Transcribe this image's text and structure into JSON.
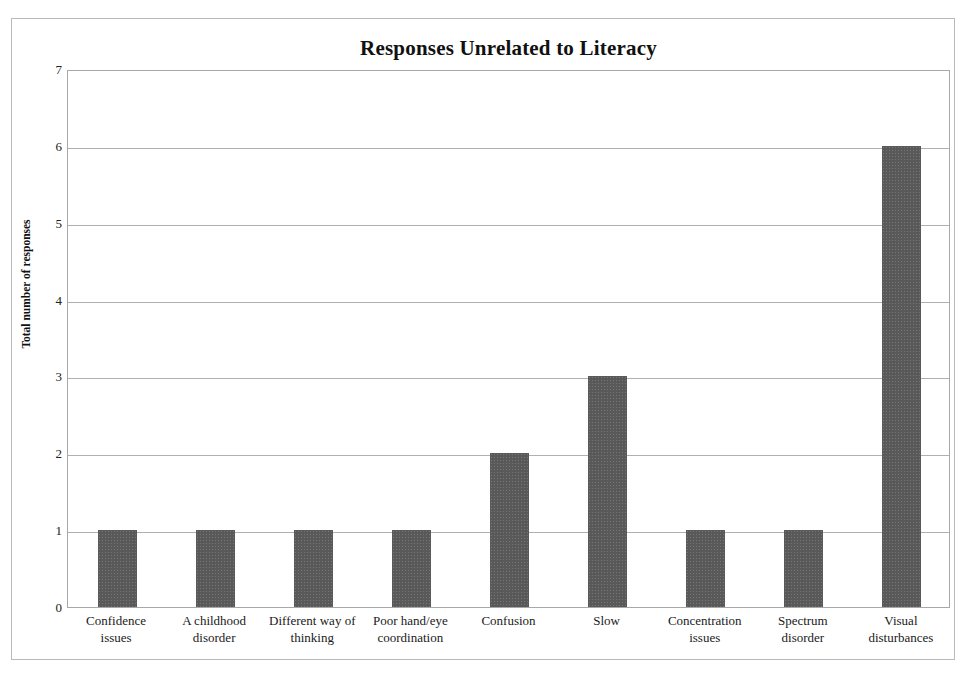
{
  "chart_data": {
    "type": "bar",
    "title": "Responses Unrelated to Literacy",
    "xlabel": "",
    "ylabel": "Total number of responses",
    "categories": [
      "Confidence issues",
      "A childhood disorder",
      "Different way of thinking",
      "Poor hand/eye coordination",
      "Confusion",
      "Slow",
      "Concentration issues",
      "Spectrum disorder",
      "Visual disturbances"
    ],
    "values": [
      1,
      1,
      1,
      1,
      2,
      3,
      1,
      1,
      6
    ],
    "ylim": [
      0,
      7
    ],
    "y_ticks": [
      0,
      1,
      2,
      3,
      4,
      5,
      6,
      7
    ],
    "y_tick_labels": [
      "0",
      "1",
      "2",
      "3",
      "4",
      "5",
      "6",
      "7"
    ],
    "grid": true,
    "legend": false,
    "bar_color": "#595959",
    "gridline_color": "#b0b0b0",
    "plot_border_color": "#a8a8a8"
  }
}
